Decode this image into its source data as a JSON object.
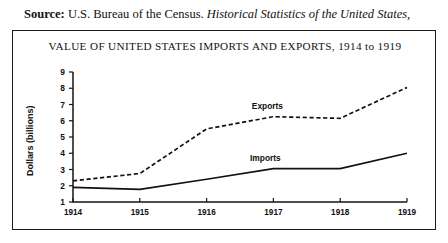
{
  "source": {
    "label": "Source:",
    "agency": "U.S. Bureau of the Census.",
    "publication": "Historical Statistics of the United States,"
  },
  "figure": {
    "title": "VALUE OF UNITED STATES IMPORTS AND EXPORTS, 1914 to 1919"
  },
  "chart_data": {
    "type": "line",
    "title": "VALUE OF UNITED STATES IMPORTS AND EXPORTS, 1914 to 1919",
    "xlabel": "",
    "ylabel": "Dollars (billions)",
    "x": [
      "1914",
      "1915",
      "1916",
      "1917",
      "1918",
      "1919"
    ],
    "categories": [
      "1914",
      "1915",
      "1916",
      "1917",
      "1918",
      "1919"
    ],
    "ylim": [
      1,
      9
    ],
    "yticks": [
      1,
      2,
      3,
      4,
      5,
      6,
      7,
      8,
      9
    ],
    "ytick_labels": [
      "1",
      "2",
      "3",
      "4",
      "5",
      "6",
      "7",
      "8",
      "9"
    ],
    "xtick_labels": [
      "1914",
      "1915",
      "1916",
      "1917",
      "1918",
      "1919"
    ],
    "grid": false,
    "legend_position": "inline-annotation",
    "series": [
      {
        "name": "Exports",
        "style": "dashed",
        "color": "#111111",
        "values": [
          2.3,
          2.75,
          5.5,
          6.25,
          6.15,
          8.05
        ]
      },
      {
        "name": "Imports",
        "style": "solid",
        "color": "#111111",
        "values": [
          1.9,
          1.78,
          2.4,
          3.05,
          3.05,
          4.0
        ]
      }
    ],
    "annotations": [
      {
        "text": "Exports",
        "series": "Exports"
      },
      {
        "text": "Imports",
        "series": "Imports"
      }
    ]
  }
}
